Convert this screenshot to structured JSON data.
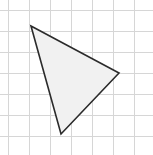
{
  "figure": {
    "width": 153,
    "height": 155,
    "background_color": "#ffffff"
  },
  "grid": {
    "line_color": "#d6d6d6",
    "line_width": 1,
    "cell_size": 21,
    "origin_x": 8,
    "origin_y": 10,
    "columns": 7,
    "rows": 7,
    "x_lines": [
      8,
      29,
      50,
      71,
      92,
      113,
      134
    ],
    "y_lines": [
      10,
      31,
      52,
      73,
      94,
      115,
      136
    ],
    "visible": true
  },
  "chart_data": {
    "type": "scatter",
    "subtitle": "",
    "xlabel": "",
    "ylabel": "",
    "grid": true,
    "legend": "none",
    "xlim": [
      8,
      150
    ],
    "ylim": [
      10,
      152
    ],
    "cell_size": 21,
    "shapes": [
      {
        "name": "triangle",
        "kind": "polygon",
        "fill_color": "#f1f1f1",
        "fill_opacity": 1,
        "stroke_color": "#2b2b2b",
        "stroke_width": 1.6,
        "vertices": [
          {
            "label": "A",
            "x": 31,
            "y": 26
          },
          {
            "label": "B",
            "x": 119,
            "y": 73
          },
          {
            "label": "C",
            "x": 61,
            "y": 134
          }
        ],
        "grid_vertices": [
          {
            "label": "A",
            "col": 1.1,
            "row": 0.8
          },
          {
            "label": "B",
            "col": 5.3,
            "row": 3.0
          },
          {
            "label": "C",
            "col": 2.5,
            "row": 5.9
          }
        ],
        "points_attr": "31,26 119,73 61,134"
      }
    ],
    "annotations": []
  }
}
